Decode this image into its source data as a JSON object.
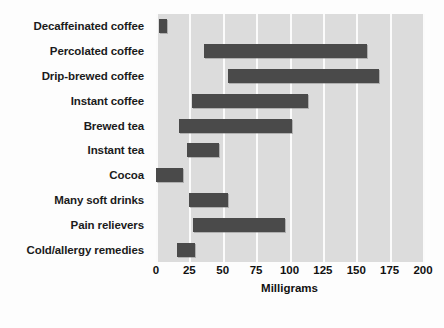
{
  "chart_data": {
    "type": "bar",
    "orientation": "horizontal",
    "bar_style": "floating-range",
    "title": "",
    "xlabel": "Milligrams",
    "ylabel": "",
    "xlim": [
      0,
      200
    ],
    "xticks": [
      0,
      25,
      50,
      75,
      100,
      125,
      150,
      175,
      200
    ],
    "xtick_labels": [
      "0",
      "25",
      "50",
      "75",
      "100",
      "125",
      "150",
      "175",
      "200"
    ],
    "grid": true,
    "grid_axis": "x",
    "legend": false,
    "categories": [
      "Decaffeinated coffee",
      "Percolated coffee",
      "Drip-brewed coffee",
      "Instant coffee",
      "Brewed tea",
      "Instant tea",
      "Cocoa",
      "Many soft drinks",
      "Pain relievers",
      "Cold/allergy remedies"
    ],
    "ranges": [
      {
        "category": "Decaffeinated coffee",
        "low": 2,
        "high": 8
      },
      {
        "category": "Percolated coffee",
        "low": 36,
        "high": 158
      },
      {
        "category": "Drip-brewed coffee",
        "low": 54,
        "high": 167
      },
      {
        "category": "Instant coffee",
        "low": 27,
        "high": 114
      },
      {
        "category": "Brewed tea",
        "low": 17,
        "high": 102
      },
      {
        "category": "Instant tea",
        "low": 23,
        "high": 47
      },
      {
        "category": "Cocoa",
        "low": 0,
        "high": 20
      },
      {
        "category": "Many soft drinks",
        "low": 25,
        "high": 54
      },
      {
        "category": "Pain relievers",
        "low": 28,
        "high": 97
      },
      {
        "category": "Cold/allergy remedies",
        "low": 16,
        "high": 29
      }
    ],
    "colors": {
      "bar": "#4a4a4a",
      "plot_background": "#dcdcdc",
      "gridline": "#fbfbfb",
      "text": "#111111",
      "figure_background": "#fdfdfd"
    }
  }
}
